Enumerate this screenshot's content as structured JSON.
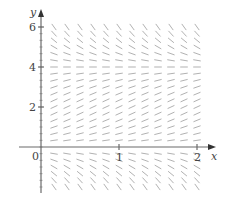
{
  "figure": {
    "background": "#ffffff",
    "axis_color": "#6b6b6b",
    "segment_color": "#a8a8a8",
    "label_color": "#444444"
  },
  "axes": {
    "x_label": "x",
    "y_label": "y",
    "x_ticks": [
      {
        "value": 1,
        "label": "1"
      },
      {
        "value": 2,
        "label": "2"
      }
    ],
    "y_ticks": [
      {
        "value": 2,
        "label": "2"
      },
      {
        "value": 4,
        "label": "4"
      },
      {
        "value": 6,
        "label": "6"
      }
    ],
    "origin_label": "0",
    "xlim": [
      -0.27,
      2.2
    ],
    "ylim": [
      -2.3,
      6.5
    ]
  },
  "chart_data": {
    "type": "slope_field",
    "title": "",
    "xlabel": "x",
    "ylabel": "y",
    "x_ticks": [
      0,
      1,
      2
    ],
    "y_ticks": [
      2,
      4,
      6
    ],
    "xlim": [
      -0.27,
      2.2
    ],
    "ylim": [
      -2.3,
      6.5
    ],
    "grid": false,
    "equilibria": [
      0,
      4
    ],
    "behavior": "slope = 0 on y=0 and y=4; positive for 0<y<4; negative for y>4 and y<0 (logistic-type dy/dx = k*y*(4-y))",
    "x_sample_positions": [
      0.1667,
      0.3333,
      0.5,
      0.6667,
      0.8333,
      1.0,
      1.1667,
      1.3333,
      1.5,
      1.6667,
      1.8333,
      2.0
    ],
    "y_sample_positions": [
      -2.0,
      -1.6667,
      -1.3333,
      -1.0,
      -0.6667,
      -0.3333,
      0.3333,
      0.6667,
      1.0,
      1.3333,
      1.6667,
      2.0,
      2.3333,
      2.6667,
      3.0,
      3.3333,
      3.6667,
      4.0,
      4.3333,
      4.6667,
      5.0,
      5.3333,
      5.6667,
      6.0
    ],
    "slope_function": "0.45*y*(4-y)"
  }
}
